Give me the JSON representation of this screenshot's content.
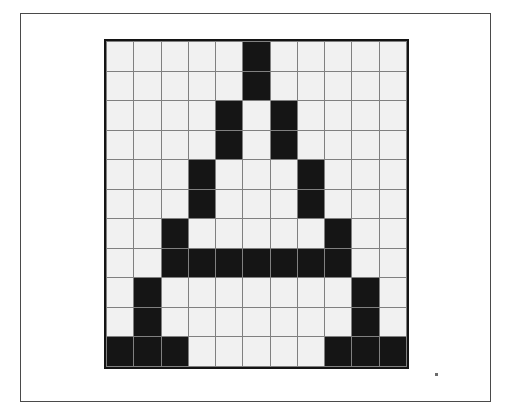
{
  "figure": {
    "caption": "",
    "background_color": "#ffffff",
    "frame_color": "#4a4a4a"
  },
  "grid": {
    "name": "pixel-bitmap-grid",
    "rows": 11,
    "columns": 11,
    "glyph": "A",
    "on_color": "#151515",
    "off_color": "#f1f1f1",
    "gridline_color": "#808080",
    "border_color": "#141414",
    "cells": [
      [
        0,
        0,
        0,
        0,
        0,
        1,
        0,
        0,
        0,
        0,
        0
      ],
      [
        0,
        0,
        0,
        0,
        0,
        1,
        0,
        0,
        0,
        0,
        0
      ],
      [
        0,
        0,
        0,
        0,
        1,
        0,
        1,
        0,
        0,
        0,
        0
      ],
      [
        0,
        0,
        0,
        0,
        1,
        0,
        1,
        0,
        0,
        0,
        0
      ],
      [
        0,
        0,
        0,
        1,
        0,
        0,
        0,
        1,
        0,
        0,
        0
      ],
      [
        0,
        0,
        0,
        1,
        0,
        0,
        0,
        1,
        0,
        0,
        0
      ],
      [
        0,
        0,
        1,
        0,
        0,
        0,
        0,
        0,
        1,
        0,
        0
      ],
      [
        0,
        0,
        1,
        1,
        1,
        1,
        1,
        1,
        1,
        0,
        0
      ],
      [
        0,
        1,
        0,
        0,
        0,
        0,
        0,
        0,
        0,
        1,
        0
      ],
      [
        0,
        1,
        0,
        0,
        0,
        0,
        0,
        0,
        0,
        1,
        0
      ],
      [
        1,
        1,
        1,
        0,
        0,
        0,
        0,
        0,
        1,
        1,
        1
      ]
    ]
  },
  "artifacts": {
    "speck_label": "",
    "speck_color": "#6b6b6b"
  }
}
